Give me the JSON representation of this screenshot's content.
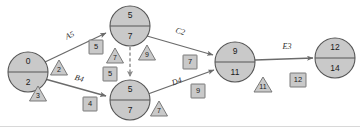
{
  "diagram": {
    "type": "pert-cpm-network",
    "colors": {
      "node_fill": "#c9c9c9",
      "node_stroke": "#565656",
      "edge_stroke": "#6b6b6b",
      "dashed_stroke": "#8a8a8a",
      "box_fill": "#c9c9c9",
      "box_stroke": "#6e6e6e",
      "background": "#ffffff"
    },
    "nodes": [
      {
        "id": "n1",
        "top": "0",
        "bottom": "2",
        "cx": 28,
        "cy": 72,
        "r": 20
      },
      {
        "id": "n2",
        "top": "5",
        "bottom": "7",
        "cx": 130,
        "cy": 26,
        "r": 20
      },
      {
        "id": "n3",
        "top": "5",
        "bottom": "7",
        "cx": 130,
        "cy": 100,
        "r": 20
      },
      {
        "id": "n4",
        "top": "9",
        "bottom": "11",
        "cx": 235,
        "cy": 62,
        "r": 20
      },
      {
        "id": "n5",
        "top": "12",
        "bottom": "14",
        "cx": 335,
        "cy": 58,
        "r": 20
      }
    ],
    "edges": [
      {
        "id": "e-a",
        "label": "A5",
        "from": "n1",
        "to": "n2",
        "style": "solid",
        "lx": 70,
        "ly": 36
      },
      {
        "id": "e-b",
        "label": "B4",
        "from": "n1",
        "to": "n3",
        "style": "solid",
        "lx": 79,
        "ly": 79
      },
      {
        "id": "e-c",
        "label": "C2",
        "from": "n2",
        "to": "n4",
        "style": "solid",
        "lx": 180,
        "ly": 32
      },
      {
        "id": "e-d",
        "label": "D4",
        "from": "n3",
        "to": "n4",
        "style": "solid",
        "lx": 177,
        "ly": 82
      },
      {
        "id": "e-e",
        "label": "E3",
        "from": "n4",
        "to": "n5",
        "style": "solid",
        "lx": 287,
        "ly": 47
      },
      {
        "id": "e-dummy",
        "label": "",
        "from": "n2",
        "to": "n3",
        "style": "dashed",
        "lx": 0,
        "ly": 0
      }
    ],
    "squares": [
      {
        "id": "sq-1",
        "value": "5",
        "x": 96,
        "y": 47
      },
      {
        "id": "sq-2",
        "value": "5",
        "x": 110,
        "y": 74
      },
      {
        "id": "sq-3",
        "value": "4",
        "x": 90,
        "y": 104
      },
      {
        "id": "sq-4",
        "value": "7",
        "x": 190,
        "y": 62
      },
      {
        "id": "sq-5",
        "value": "9",
        "x": 198,
        "y": 91
      },
      {
        "id": "sq-6",
        "value": "12",
        "x": 298,
        "y": 80
      }
    ],
    "triangles": [
      {
        "id": "tri-1",
        "value": "2",
        "x": 59,
        "y": 68
      },
      {
        "id": "tri-2",
        "value": "3",
        "x": 38,
        "y": 94
      },
      {
        "id": "tri-3",
        "value": "7",
        "x": 115,
        "y": 56
      },
      {
        "id": "tri-4",
        "value": "9",
        "x": 147,
        "y": 53
      },
      {
        "id": "tri-5",
        "value": "7",
        "x": 159,
        "y": 109
      },
      {
        "id": "tri-6",
        "value": "11",
        "x": 263,
        "y": 85
      }
    ]
  }
}
